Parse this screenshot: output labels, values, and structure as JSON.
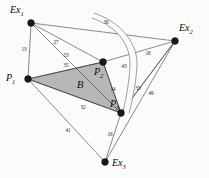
{
  "figure": {
    "width": 209,
    "height": 178,
    "background_color": "#fefefe",
    "region_fill_color": "#b3b3b3",
    "edge_color": "#3a3a3a",
    "node_color": "#1a1a1a"
  },
  "nodes": [
    {
      "id": "Ex1",
      "label_main": "Ex",
      "label_sub": "1",
      "x": 31,
      "y": 23,
      "label_x": 10,
      "label_y": 11,
      "radius": 3.4
    },
    {
      "id": "Ex2",
      "label_main": "Ex",
      "label_sub": "2",
      "x": 175,
      "y": 41,
      "label_x": 179,
      "label_y": 29,
      "radius": 3.4
    },
    {
      "id": "Ex3",
      "label_main": "Ex",
      "label_sub": "3",
      "x": 105,
      "y": 162,
      "label_x": 112,
      "label_y": 164,
      "radius": 3.4
    },
    {
      "id": "P1",
      "label_main": "P",
      "label_sub": "1",
      "x": 28,
      "y": 79,
      "label_x": 6,
      "label_y": 79,
      "radius": 3.4
    },
    {
      "id": "P2",
      "label_main": "P",
      "label_sub": "2",
      "x": 103,
      "y": 62,
      "label_x": 94,
      "label_y": 73,
      "radius": 3.4
    },
    {
      "id": "P3",
      "label_main": "P",
      "label_sub": "3",
      "x": 121,
      "y": 113,
      "label_x": 110,
      "label_y": 105,
      "radius": 3.4
    }
  ],
  "region": {
    "name": "B",
    "label": "B",
    "label_x": 80,
    "label_y": 85,
    "vertices": [
      "P1",
      "P2",
      "P3"
    ]
  },
  "edges": [
    {
      "id": "e-ex1-ex2",
      "from": "Ex1",
      "to": "Ex2",
      "weight": "30",
      "label_x": 106,
      "label_y": 23
    },
    {
      "id": "e-ex1-p1",
      "from": "Ex1",
      "to": "P1",
      "weight": "13",
      "label_x": 24,
      "label_y": 50
    },
    {
      "id": "e-ex1-p2",
      "from": "Ex1",
      "to": "P2",
      "weight": "27",
      "label_x": 56,
      "label_y": 43
    },
    {
      "id": "e-ex1-p3",
      "from": "Ex1",
      "to": "P3",
      "weight": "53",
      "label_x": 66,
      "label_y": 56
    },
    {
      "id": "e-p1-p2",
      "from": "P1",
      "to": "P2",
      "weight": "35",
      "label_x": 66,
      "label_y": 66
    },
    {
      "id": "e-ex2-p2",
      "from": "Ex2",
      "to": "P2",
      "weight": "18",
      "label_x": 148,
      "label_y": 54
    },
    {
      "id": "e-ex2-p3",
      "from": "Ex2",
      "to": "P3",
      "weight": "43",
      "label_x": 124,
      "label_y": 67
    },
    {
      "id": "e-p2-p3",
      "from": "P2",
      "to": "P3",
      "weight": "14",
      "label_x": 113,
      "label_y": 90
    },
    {
      "id": "e-ex2-ex3",
      "from": "Ex2",
      "to": "Ex3",
      "weight": "49",
      "label_x": 151,
      "label_y": 94
    },
    {
      "id": "e-ex2-p3b",
      "from": "Ex2",
      "to": "P3",
      "weight": "33",
      "label_x": 138,
      "label_y": 89
    },
    {
      "id": "e-p1-p3",
      "from": "P1",
      "to": "P3",
      "weight": "32",
      "label_x": 83,
      "label_y": 108
    },
    {
      "id": "e-p1-ex3",
      "from": "P1",
      "to": "Ex3",
      "weight": "41",
      "label_x": 68,
      "label_y": 131
    },
    {
      "id": "e-ex3-p3",
      "from": "Ex3",
      "to": "P3",
      "weight": "16",
      "label_x": 110,
      "label_y": 135
    }
  ],
  "occluder": {
    "name": "white-arc-band",
    "description": "light curved band sweeping from upper area down past P2 and P3"
  }
}
